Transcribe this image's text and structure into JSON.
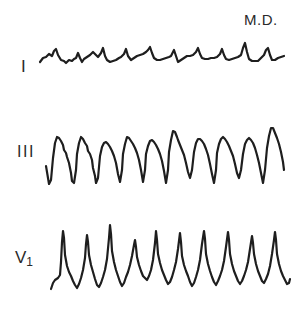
{
  "figure": {
    "patient_label": "M.D.",
    "leads": [
      {
        "name": "I",
        "label": "I"
      },
      {
        "name": "III",
        "label": "III"
      },
      {
        "name": "V1",
        "label_main": "V",
        "label_sub": "1"
      }
    ],
    "trace_color": "#1e1e1e",
    "background": "#ffffff"
  }
}
